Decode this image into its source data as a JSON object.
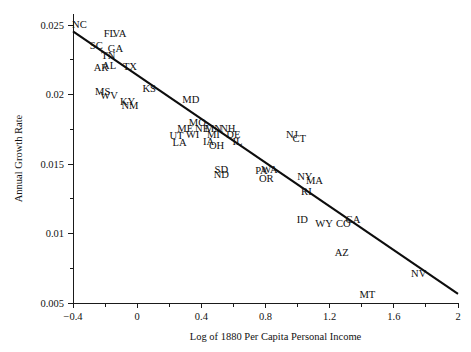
{
  "chart_data": {
    "type": "scatter",
    "title": "",
    "xlabel": "Log of 1880 Per Capita Personal Income",
    "ylabel": "Annual Growth Rate",
    "xlim": [
      -0.4,
      2.0
    ],
    "ylim": [
      0.005,
      0.0258
    ],
    "grid": false,
    "legend": null,
    "point_style": "text-label-only",
    "xticks": [
      -0.4,
      0,
      0.4,
      0.8,
      1.2,
      1.6,
      2
    ],
    "xtick_labels": [
      "-0.4",
      "0",
      "0.4",
      "0.8",
      "1.2",
      "1.6",
      "2"
    ],
    "xminor_ticks": [
      -0.2,
      0.2,
      0.6,
      1.0,
      1.4,
      1.8
    ],
    "yticks": [
      0.005,
      0.01,
      0.015,
      0.02,
      0.025
    ],
    "ytick_labels": [
      "0.005",
      "0.01",
      "0.015",
      "0.02",
      "0.025"
    ],
    "yminor_ticks": [
      0.0075,
      0.0125,
      0.0175,
      0.0225
    ],
    "fit_line": {
      "label": "regression-line",
      "x_start": -0.4,
      "y_start": 0.02455,
      "x_end": 2.0,
      "y_end": 0.00565
    },
    "points": [
      {
        "label": "NC",
        "x": -0.36,
        "y": 0.02495
      },
      {
        "label": "FL",
        "x": -0.17,
        "y": 0.02435
      },
      {
        "label": "VA",
        "x": -0.11,
        "y": 0.02435
      },
      {
        "label": "SC",
        "x": -0.255,
        "y": 0.02345
      },
      {
        "label": "GA",
        "x": -0.135,
        "y": 0.02325
      },
      {
        "label": "TN",
        "x": -0.18,
        "y": 0.02275
      },
      {
        "label": "AL",
        "x": -0.175,
        "y": 0.02205
      },
      {
        "label": "AR",
        "x": -0.225,
        "y": 0.02185
      },
      {
        "label": "TX",
        "x": -0.045,
        "y": 0.02195
      },
      {
        "label": "MS",
        "x": -0.215,
        "y": 0.02015
      },
      {
        "label": "WV",
        "x": -0.175,
        "y": 0.01985
      },
      {
        "label": "KS",
        "x": 0.075,
        "y": 0.02035
      },
      {
        "label": "KY",
        "x": -0.06,
        "y": 0.01945
      },
      {
        "label": "NM",
        "x": -0.045,
        "y": 0.01915
      },
      {
        "label": "MD",
        "x": 0.335,
        "y": 0.01955
      },
      {
        "label": "MO",
        "x": 0.375,
        "y": 0.01795
      },
      {
        "label": "ME",
        "x": 0.3,
        "y": 0.01745
      },
      {
        "label": "NE",
        "x": 0.405,
        "y": 0.01745
      },
      {
        "label": "MN",
        "x": 0.475,
        "y": 0.01745
      },
      {
        "label": "NH",
        "x": 0.565,
        "y": 0.01745
      },
      {
        "label": "UT",
        "x": 0.245,
        "y": 0.01695
      },
      {
        "label": "WI",
        "x": 0.345,
        "y": 0.01705
      },
      {
        "label": "MI",
        "x": 0.475,
        "y": 0.01705
      },
      {
        "label": "DE",
        "x": 0.6,
        "y": 0.01705
      },
      {
        "label": "LA",
        "x": 0.265,
        "y": 0.01645
      },
      {
        "label": "IA",
        "x": 0.445,
        "y": 0.01655
      },
      {
        "label": "OH",
        "x": 0.495,
        "y": 0.01625
      },
      {
        "label": "IL",
        "x": 0.625,
        "y": 0.01655
      },
      {
        "label": "NJ",
        "x": 0.965,
        "y": 0.01705
      },
      {
        "label": "CT",
        "x": 1.01,
        "y": 0.01675
      },
      {
        "label": "SD",
        "x": 0.525,
        "y": 0.01455
      },
      {
        "label": "ND",
        "x": 0.525,
        "y": 0.01415
      },
      {
        "label": "PA",
        "x": 0.775,
        "y": 0.01445
      },
      {
        "label": "WA",
        "x": 0.825,
        "y": 0.01455
      },
      {
        "label": "OR",
        "x": 0.805,
        "y": 0.01385
      },
      {
        "label": "NY",
        "x": 1.045,
        "y": 0.01405
      },
      {
        "label": "MA",
        "x": 1.105,
        "y": 0.01375
      },
      {
        "label": "RI",
        "x": 1.055,
        "y": 0.01295
      },
      {
        "label": "ID",
        "x": 1.03,
        "y": 0.01095
      },
      {
        "label": "WY",
        "x": 1.165,
        "y": 0.01065
      },
      {
        "label": "CO",
        "x": 1.285,
        "y": 0.01065
      },
      {
        "label": "CA",
        "x": 1.345,
        "y": 0.01095
      },
      {
        "label": "AZ",
        "x": 1.275,
        "y": 0.00855
      },
      {
        "label": "NV",
        "x": 1.755,
        "y": 0.00705
      },
      {
        "label": "MT",
        "x": 1.435,
        "y": 0.00555
      }
    ]
  }
}
